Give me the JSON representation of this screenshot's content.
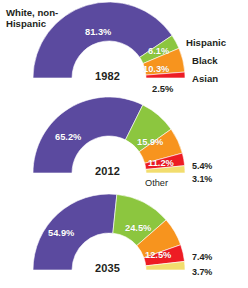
{
  "figure": {
    "type": "half-donut-series",
    "background": "#ffffff"
  },
  "legend": {
    "white_label_line1": "White, non-",
    "white_label_line2": "Hispanic",
    "hispanic_label": "Hispanic",
    "black_label": "Black",
    "asian_label": "Asian",
    "other_label": "Other"
  },
  "colors": {
    "white_non_hispanic": "#5b4a9f",
    "hispanic": "#8cc63f",
    "black": "#f7941e",
    "asian": "#ed1c24",
    "other": "#f2dd6e"
  },
  "charts": [
    {
      "year": "1982",
      "segments": [
        {
          "name": "White, non-Hispanic",
          "value": 81.3,
          "label": "81.3%",
          "color": "#5b4a9f",
          "label_inside": true
        },
        {
          "name": "Hispanic",
          "value": 6.1,
          "label": "6.1%",
          "color": "#8cc63f",
          "label_inside": true
        },
        {
          "name": "Black",
          "value": 10.3,
          "label": "10.3%",
          "color": "#f7941e",
          "label_inside": true
        },
        {
          "name": "Asian",
          "value": 2.5,
          "label": "2.5%",
          "color": "#ed1c24",
          "label_inside": false
        }
      ]
    },
    {
      "year": "2012",
      "segments": [
        {
          "name": "White, non-Hispanic",
          "value": 65.2,
          "label": "65.2%",
          "color": "#5b4a9f",
          "label_inside": true
        },
        {
          "name": "Hispanic",
          "value": 15.9,
          "label": "15.9%",
          "color": "#8cc63f",
          "label_inside": true
        },
        {
          "name": "Black",
          "value": 11.2,
          "label": "11.2%",
          "color": "#f7941e",
          "label_inside": true
        },
        {
          "name": "Asian",
          "value": 5.4,
          "label": "5.4%",
          "color": "#ed1c24",
          "label_inside": false
        },
        {
          "name": "Other",
          "value": 3.1,
          "label": "3.1%",
          "color": "#f2dd6e",
          "label_inside": false
        }
      ]
    },
    {
      "year": "2035",
      "segments": [
        {
          "name": "White, non-Hispanic",
          "value": 54.9,
          "label": "54.9%",
          "color": "#5b4a9f",
          "label_inside": true
        },
        {
          "name": "Hispanic",
          "value": 24.5,
          "label": "24.5%",
          "color": "#8cc63f",
          "label_inside": true
        },
        {
          "name": "Black",
          "value": 12.5,
          "label": "12.5%",
          "color": "#f7941e",
          "label_inside": true
        },
        {
          "name": "Asian",
          "value": 7.4,
          "label": "7.4%",
          "color": "#ed1c24",
          "label_inside": false
        },
        {
          "name": "Other",
          "value": 3.7,
          "label": "3.7%",
          "color": "#f2dd6e",
          "label_inside": false
        }
      ]
    }
  ],
  "chart_data": {
    "type": "pie",
    "title": "",
    "subtype": "half-donut (semicircular ring) series over three years",
    "categories": [
      "White, non-Hispanic",
      "Hispanic",
      "Black",
      "Asian",
      "Other"
    ],
    "category_colors": [
      "#5b4a9f",
      "#8cc63f",
      "#f7941e",
      "#ed1c24",
      "#f2dd6e"
    ],
    "series": [
      {
        "name": "1982",
        "values": [
          81.3,
          6.1,
          10.3,
          2.5,
          null
        ]
      },
      {
        "name": "2012",
        "values": [
          65.2,
          15.9,
          11.2,
          5.4,
          3.1
        ]
      },
      {
        "name": "2035",
        "values": [
          54.9,
          24.5,
          12.5,
          7.4,
          3.7
        ]
      }
    ],
    "value_labels": {
      "1982": [
        "81.3%",
        "6.1%",
        "10.3%",
        "2.5%",
        ""
      ],
      "2012": [
        "65.2%",
        "15.9%",
        "11.2%",
        "5.4%",
        "3.1%"
      ],
      "2035": [
        "54.9%",
        "24.5%",
        "12.5%",
        "7.4%",
        "3.7%"
      ]
    },
    "units": "percent",
    "total": 100,
    "legend_position": "right-and-left (direct category annotations on 1982 chart)",
    "grid": false,
    "xlabel": "",
    "ylabel": "",
    "annotations": [
      "White, non-Hispanic",
      "Hispanic",
      "Black",
      "Asian",
      "Other"
    ]
  }
}
